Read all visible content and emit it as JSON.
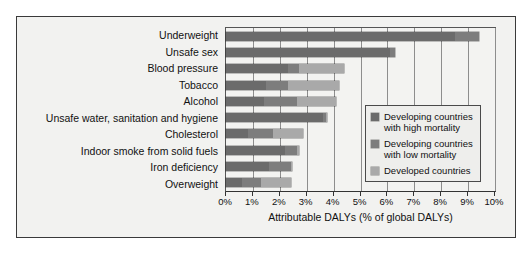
{
  "chart_data": {
    "type": "bar",
    "orientation": "horizontal",
    "stacked": true,
    "title": "",
    "xlabel": "Attributable DALYs (% of global DALYs)",
    "ylabel": "",
    "xlim": [
      0,
      10
    ],
    "xticks": [
      "0%",
      "1%",
      "2%",
      "3%",
      "4%",
      "5%",
      "6%",
      "7%",
      "8%",
      "9%",
      "10%"
    ],
    "grid": true,
    "legend_position": "middle-right",
    "categories": [
      "Underweight",
      "Unsafe sex",
      "Blood pressure",
      "Tobacco",
      "Alcohol",
      "Unsafe water, sanitation and hygiene",
      "Cholesterol",
      "Indoor smoke from solid fuels",
      "Iron deficiency",
      "Overweight"
    ],
    "series": [
      {
        "name": "Developing countries with high mortality",
        "color": "#6b6b6b",
        "values": [
          8.5,
          6.1,
          2.3,
          1.5,
          1.4,
          3.6,
          0.8,
          2.2,
          1.6,
          0.6
        ]
      },
      {
        "name": "Developing countries with low mortality",
        "color": "#7d7d7d",
        "values": [
          0.9,
          0.2,
          0.4,
          0.8,
          1.25,
          0.1,
          0.95,
          0.45,
          0.8,
          0.7
        ]
      },
      {
        "name": "Developed countries",
        "color": "#a9a9a9",
        "values": [
          0.0,
          0.0,
          1.7,
          1.9,
          1.45,
          0.05,
          1.1,
          0.05,
          0.05,
          1.1
        ]
      }
    ],
    "totals": [
      9.4,
      6.3,
      4.4,
      4.2,
      4.1,
      3.75,
      2.85,
      2.7,
      2.45,
      2.4
    ]
  },
  "legend": {
    "items": [
      {
        "label": "Developing countries\nwith high mortality",
        "color": "#6b6b6b"
      },
      {
        "label": "Developing countries\nwith low mortality",
        "color": "#7d7d7d"
      },
      {
        "label": "Developed countries",
        "color": "#a9a9a9"
      }
    ]
  }
}
